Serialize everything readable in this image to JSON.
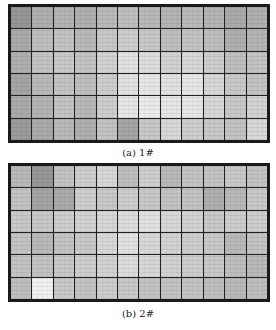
{
  "figure": {
    "panels": [
      {
        "caption": "(a)  1#",
        "rows": 6,
        "cols": 12,
        "shades": [
          [
            150,
            175,
            180,
            175,
            185,
            190,
            185,
            180,
            185,
            180,
            170,
            175
          ],
          [
            170,
            190,
            195,
            185,
            200,
            205,
            200,
            190,
            195,
            190,
            175,
            180
          ],
          [
            175,
            195,
            200,
            195,
            210,
            225,
            220,
            210,
            215,
            205,
            190,
            195
          ],
          [
            165,
            185,
            195,
            190,
            205,
            225,
            230,
            225,
            230,
            215,
            200,
            195
          ],
          [
            170,
            180,
            195,
            185,
            205,
            230,
            235,
            230,
            230,
            215,
            200,
            210
          ],
          [
            155,
            170,
            185,
            175,
            195,
            165,
            200,
            215,
            205,
            200,
            195,
            215
          ]
        ]
      },
      {
        "caption": "(b)  2#",
        "rows": 6,
        "cols": 12,
        "shades": [
          [
            185,
            150,
            195,
            205,
            215,
            190,
            205,
            185,
            195,
            195,
            200,
            195
          ],
          [
            195,
            165,
            170,
            205,
            200,
            205,
            200,
            195,
            195,
            175,
            185,
            200
          ],
          [
            200,
            200,
            205,
            210,
            215,
            220,
            225,
            215,
            210,
            200,
            205,
            205
          ],
          [
            195,
            185,
            195,
            200,
            215,
            225,
            215,
            210,
            205,
            200,
            185,
            195
          ],
          [
            195,
            195,
            200,
            205,
            210,
            220,
            215,
            210,
            205,
            200,
            190,
            185
          ],
          [
            190,
            240,
            200,
            195,
            205,
            200,
            195,
            195,
            195,
            190,
            185,
            190
          ]
        ]
      }
    ]
  }
}
